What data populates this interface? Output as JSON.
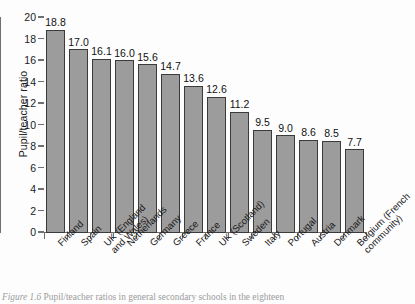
{
  "figure": {
    "caption_prefix": "Figure 1.6",
    "caption_text": "Pupil/teacher ratios in general secondary schools in the eighteen",
    "background_color": "#fdfdfd"
  },
  "chart_data": {
    "type": "bar",
    "title": "",
    "xlabel": "",
    "ylabel": "Pupil/teacher ratio",
    "ylim": [
      0,
      20
    ],
    "grid": false,
    "legend": null,
    "bar_color": "#9c9c9c",
    "bar_edge_color": "#3b3b3b",
    "y_ticks": [
      0,
      2,
      4,
      6,
      8,
      10,
      12,
      14,
      16,
      18,
      20
    ],
    "y_tick_labels": [
      "0",
      "2",
      "4",
      "6",
      "8",
      "10",
      "12",
      "14",
      "16",
      "18",
      "20"
    ],
    "categories": [
      "Finland",
      "Spain",
      "UK (England and Wales)",
      "Netherlands",
      "Germany",
      "Greece",
      "France",
      "UK (Scotland)",
      "Sweden",
      "Italy",
      "Portugal",
      "Austria",
      "Denmark",
      "Belgium (French community)"
    ],
    "category_lines": [
      [
        "Finland"
      ],
      [
        "Spain"
      ],
      [
        "UK (England",
        "and Wales)"
      ],
      [
        "Netherlands"
      ],
      [
        "Germany"
      ],
      [
        "Greece"
      ],
      [
        "France"
      ],
      [
        "UK (Scotland)"
      ],
      [
        "Sweden"
      ],
      [
        "Italy"
      ],
      [
        "Portugal"
      ],
      [
        "Austria"
      ],
      [
        "Denmark"
      ],
      [
        "Belgium (French",
        "community)"
      ]
    ],
    "values": [
      18.8,
      17.0,
      16.1,
      16.0,
      15.6,
      14.7,
      13.6,
      12.6,
      11.2,
      9.5,
      9.0,
      8.6,
      8.5,
      7.7
    ],
    "value_labels": [
      "18.8",
      "17.0",
      "16.1",
      "16.0",
      "15.6",
      "14.7",
      "13.6",
      "12.6",
      "11.2",
      "9.5",
      "9.0",
      "8.6",
      "8.5",
      "7.7"
    ]
  }
}
